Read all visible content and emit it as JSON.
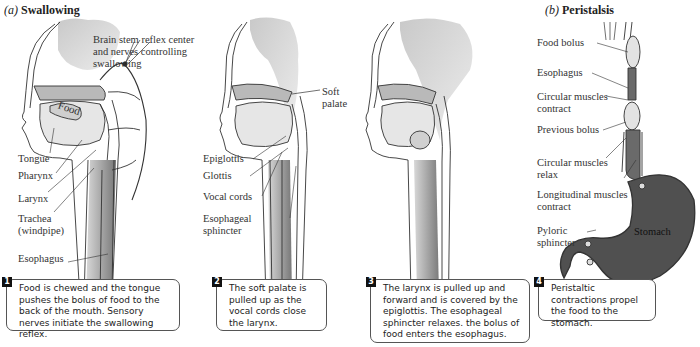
{
  "panels": {
    "a": {
      "letter": "(a)",
      "title": "Swallowing"
    },
    "b": {
      "letter": "(b)",
      "title": "Peristalsis"
    }
  },
  "labels_a1": {
    "brain_stem": [
      "Brain stem reflex center",
      "and nerves controlling",
      "swallowing"
    ],
    "food": "Food",
    "tongue": "Tongue",
    "pharynx": "Pharynx",
    "larynx": "Larynx",
    "trachea": [
      "Trachea",
      "(windpipe)"
    ],
    "esophagus": "Esophagus"
  },
  "labels_a2": {
    "soft_palate": [
      "Soft",
      "palate"
    ],
    "epiglottis": "Epiglottis",
    "glottis": "Glottis",
    "vocal_cords": "Vocal cords",
    "esophageal_sphincter": [
      "Esophageal",
      "sphincter"
    ]
  },
  "labels_b": {
    "food_bolus": "Food bolus",
    "esophagus": "Esophagus",
    "circular_contract": [
      "Circular muscles",
      "contract"
    ],
    "previous_bolus": "Previous bolus",
    "circular_relax": [
      "Circular muscles",
      "relax"
    ],
    "longitudinal_contract": [
      "Longitudinal muscles",
      "contract"
    ],
    "pyloric_sphincter": [
      "Pyloric",
      "sphincter"
    ],
    "stomach": "Stomach"
  },
  "captions": [
    {
      "number": "1",
      "text": "Food is chewed and the tongue pushes the bolus of food to the back of the mouth. Sensory nerves initiate the swallowing reflex."
    },
    {
      "number": "2",
      "text": "The soft palate is pulled up as the vocal cords close the larynx."
    },
    {
      "number": "3",
      "text": "The larynx is pulled up and forward and is covered by the epiglottis. The esophageal sphincter relaxes. the bolus of food enters the esophagus."
    },
    {
      "number": "4",
      "text": "Peristaltic contractions propel the food to the stomach."
    }
  ],
  "colors": {
    "brain": "#d4d4d4",
    "tissue": "#e6e6e6",
    "palate": "#b9b9b9",
    "esophagus_dark": "#6a6a6a",
    "stomach": "#505050",
    "outline": "#333333"
  }
}
